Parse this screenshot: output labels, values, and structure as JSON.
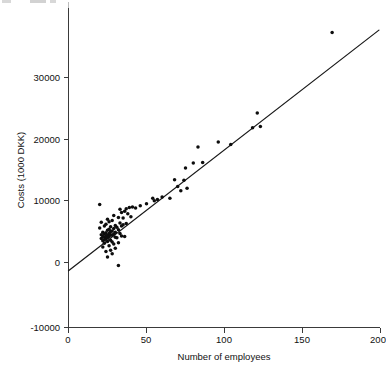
{
  "chart_data": {
    "type": "scatter",
    "title": "",
    "xlabel": "Number of employees",
    "ylabel": "Costs (1000 DKK)",
    "xlim": [
      0,
      200
    ],
    "ylim": [
      -10000,
      38000
    ],
    "xticks": [
      0,
      50,
      100,
      150,
      200
    ],
    "xtick_labels": [
      "0",
      "50",
      "100",
      "150",
      "200"
    ],
    "yticks": [
      -10000,
      0,
      10000,
      20000,
      30000
    ],
    "ytick_labels": [
      "-10000",
      "0",
      "10000",
      "20000",
      "30000"
    ],
    "grid": false,
    "legend": null,
    "point_color": "#0d0d0d",
    "line_color": "#1a1a1a",
    "axis_color": "#3a3a3a",
    "series": [
      {
        "name": "Firms",
        "marker": "circle",
        "points": [
          [
            20,
            9400
          ],
          [
            20,
            5600
          ],
          [
            21,
            6500
          ],
          [
            21,
            4500
          ],
          [
            21,
            3900
          ],
          [
            22,
            4900
          ],
          [
            22,
            4200
          ],
          [
            22,
            3500
          ],
          [
            22,
            2500
          ],
          [
            23,
            5900
          ],
          [
            23,
            4600
          ],
          [
            23,
            4100
          ],
          [
            23,
            3700
          ],
          [
            23,
            3100
          ],
          [
            24,
            6200
          ],
          [
            24,
            4800
          ],
          [
            24,
            4300
          ],
          [
            24,
            3800
          ],
          [
            24,
            1800
          ],
          [
            25,
            7000
          ],
          [
            25,
            5200
          ],
          [
            25,
            4400
          ],
          [
            25,
            4000
          ],
          [
            25,
            3400
          ],
          [
            25,
            900
          ],
          [
            26,
            6600
          ],
          [
            26,
            5400
          ],
          [
            26,
            4700
          ],
          [
            26,
            4200
          ],
          [
            26,
            2700
          ],
          [
            27,
            5800
          ],
          [
            27,
            5000
          ],
          [
            27,
            4500
          ],
          [
            27,
            3600
          ],
          [
            27,
            2000
          ],
          [
            28,
            6800
          ],
          [
            28,
            5100
          ],
          [
            28,
            4400
          ],
          [
            28,
            3300
          ],
          [
            28,
            1400
          ],
          [
            29,
            7600
          ],
          [
            29,
            5500
          ],
          [
            29,
            4600
          ],
          [
            29,
            3000
          ],
          [
            30,
            6000
          ],
          [
            30,
            4900
          ],
          [
            30,
            4100
          ],
          [
            30,
            2300
          ],
          [
            31,
            5700
          ],
          [
            31,
            4000
          ],
          [
            32,
            7300
          ],
          [
            32,
            5300
          ],
          [
            32,
            3200
          ],
          [
            32,
            -500
          ],
          [
            33,
            8600
          ],
          [
            33,
            6400
          ],
          [
            33,
            4700
          ],
          [
            34,
            8100
          ],
          [
            34,
            5900
          ],
          [
            34,
            4300
          ],
          [
            35,
            7200
          ],
          [
            35,
            6100
          ],
          [
            36,
            8300
          ],
          [
            36,
            4200
          ],
          [
            37,
            8700
          ],
          [
            37,
            6300
          ],
          [
            38,
            7900
          ],
          [
            39,
            8900
          ],
          [
            40,
            7400
          ],
          [
            41,
            9000
          ],
          [
            43,
            8800
          ],
          [
            46,
            9200
          ],
          [
            50,
            9500
          ],
          [
            54,
            10400
          ],
          [
            55,
            10000
          ],
          [
            57,
            10200
          ],
          [
            60,
            10600
          ],
          [
            65,
            10400
          ],
          [
            68,
            13400
          ],
          [
            70,
            12300
          ],
          [
            72,
            11600
          ],
          [
            74,
            13300
          ],
          [
            75,
            15300
          ],
          [
            76,
            12000
          ],
          [
            80,
            16100
          ],
          [
            83,
            18700
          ],
          [
            86,
            16200
          ],
          [
            96,
            19500
          ],
          [
            104,
            19100
          ],
          [
            118,
            21800
          ],
          [
            121,
            24200
          ],
          [
            123,
            22000
          ],
          [
            169,
            37200
          ]
        ]
      }
    ],
    "fit_line": {
      "name": "regression-line",
      "x_start": 0,
      "y_start": -1350,
      "x_end": 199,
      "y_end": 37600
    }
  },
  "axes": {
    "x_title": "Number of employees",
    "y_title": "Costs (1000 DKK)"
  }
}
